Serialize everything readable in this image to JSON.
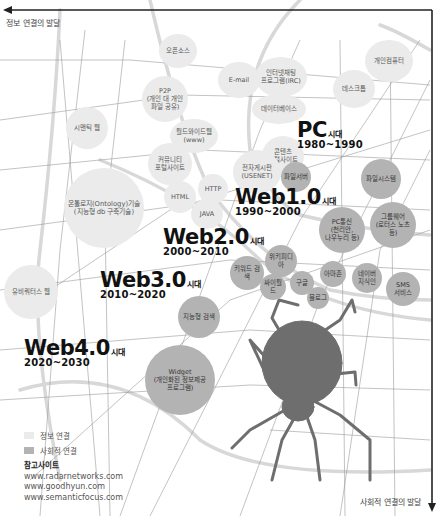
{
  "axes": {
    "horizontal_label": "정보 연결의 발달",
    "vertical_label": "사회적 연결의 발달"
  },
  "eras": [
    {
      "id": "pc",
      "name": "PC",
      "suffix": "시대",
      "years": "1980~1990"
    },
    {
      "id": "web1",
      "name": "Web1.0",
      "suffix": "시대",
      "years": "1990~2000"
    },
    {
      "id": "web2",
      "name": "Web2.0",
      "suffix": "시대",
      "years": "2000~2010"
    },
    {
      "id": "web3",
      "name": "Web3.0",
      "suffix": "시대",
      "years": "2010~2020"
    },
    {
      "id": "web4",
      "name": "Web4.0",
      "suffix": "시대",
      "years": "2020~2030"
    }
  ],
  "info_bubbles": [
    {
      "label": "오픈소스"
    },
    {
      "label": "E-mail"
    },
    {
      "label": "인터넷채팅\n프로그램(IRC)"
    },
    {
      "label": "데스크톱"
    },
    {
      "label": "개인컴퓨터"
    },
    {
      "label": "P2P\n(개인 대 개인\n파일 공유)"
    },
    {
      "label": "데이터베이스"
    },
    {
      "label": "시맨틱 웹"
    },
    {
      "label": "월드와이드웹\n(www)"
    },
    {
      "label": "커뮤니티\n포털사이트"
    },
    {
      "label": "콘텐츠\n포털사이트"
    },
    {
      "label": "전자게시판\n(USENET)"
    },
    {
      "label": "HTTP"
    },
    {
      "label": "HTML"
    },
    {
      "label": "JAVA"
    },
    {
      "label": "온톨로지(Ontology)기술\n(지능형 db 구축기술)"
    },
    {
      "label": "유비쿼터스 웹"
    }
  ],
  "social_bubbles": [
    {
      "label": "파일서버"
    },
    {
      "label": "파일시스템"
    },
    {
      "label": "PC통신\n(천리안,\n나우누리 등)"
    },
    {
      "label": "그룹웨어\n(로터스 노츠 등)"
    },
    {
      "label": "위키피디아"
    },
    {
      "label": "키워드 검색"
    },
    {
      "label": "아마존"
    },
    {
      "label": "싸이월드"
    },
    {
      "label": "구글"
    },
    {
      "label": "네이버\n지식인"
    },
    {
      "label": "SMS\n서비스"
    },
    {
      "label": "블로그"
    },
    {
      "label": "지능형 검색"
    },
    {
      "label": "Widget\n(개인화된 정보제공\n프로그램)"
    }
  ],
  "legend": {
    "items": [
      {
        "label": "정보 연결",
        "color": "#ebebeb"
      },
      {
        "label": "사회적 연결",
        "color": "#b3b3b3"
      }
    ]
  },
  "references": {
    "title": "참고사이트",
    "sites": [
      "www.radarnetworks.com",
      "www.goodhyun.com",
      "www.semanticfocus.com"
    ]
  },
  "colors": {
    "info_connection": "#ebebeb",
    "social_connection": "#b3b3b3",
    "spider": "#6e6e6e",
    "axis": "#222222"
  }
}
